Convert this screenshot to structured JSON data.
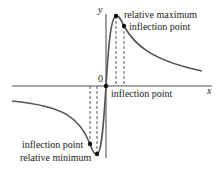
{
  "figure": {
    "axes": {
      "x_label": "x",
      "y_label": "y",
      "origin_label": "0"
    },
    "annotations": {
      "relative_maximum": "relative maximum",
      "inflection_upper": "inflection point",
      "inflection_origin": "inflection point",
      "inflection_lower": "inflection point",
      "relative_minimum": "relative minimum"
    },
    "colors": {
      "curve": "#555555",
      "axes": "#888888",
      "text": "#222222"
    }
  }
}
